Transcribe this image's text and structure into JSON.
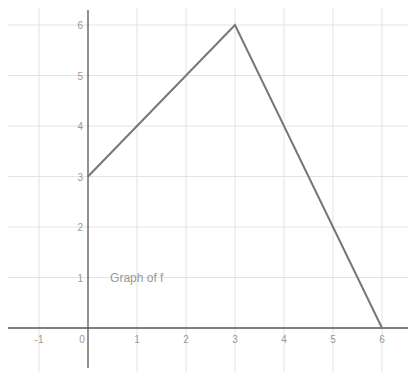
{
  "chart_data": {
    "type": "line",
    "title": "",
    "annotation": {
      "text": "Graph of f",
      "x": 0.45,
      "y": 1
    },
    "xlabel": "",
    "ylabel": "",
    "xlim": [
      -1.6,
      6.5
    ],
    "ylim": [
      -0.8,
      6.3
    ],
    "x_ticks": [
      -1,
      0,
      1,
      2,
      3,
      4,
      5,
      6
    ],
    "y_ticks": [
      1,
      2,
      3,
      4,
      5,
      6
    ],
    "grid": true,
    "legend": null,
    "series": [
      {
        "name": "f",
        "x": [
          0,
          3,
          6
        ],
        "y": [
          3,
          6,
          0
        ]
      }
    ]
  },
  "colors": {
    "grid": "#e3e3e3",
    "axis": "#555555",
    "line": "#777777",
    "tick_label": "#999999",
    "annotation": "#999999"
  }
}
